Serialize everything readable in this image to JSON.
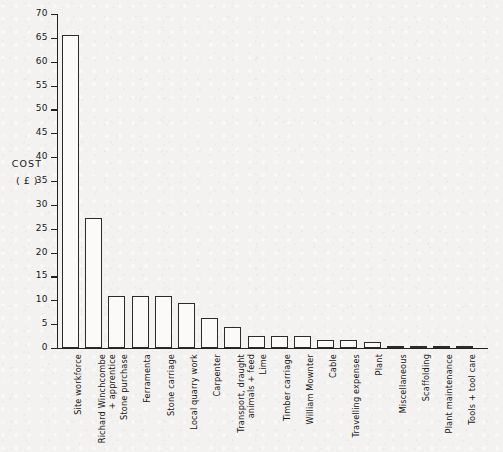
{
  "chart_data": {
    "type": "bar",
    "title": "",
    "xlabel": "",
    "ylabel": "COST",
    "ylabel_unit": "( £ )",
    "ylim": [
      0,
      70
    ],
    "ytick_step": 5,
    "yticks": [
      0,
      5,
      10,
      15,
      20,
      25,
      30,
      35,
      40,
      45,
      50,
      55,
      60,
      65,
      70
    ],
    "ytick_labels": [
      "0",
      "5",
      "10",
      "15",
      "20",
      "25",
      "30",
      "35",
      "40",
      "45",
      "50",
      "55",
      "60",
      "65",
      "70"
    ],
    "grid": false,
    "legend": "none",
    "orientation": "vertical",
    "bar_style": "outline",
    "categories": [
      "Site workforce",
      "Richard Winchcombe + apprentice",
      "Stone purchase",
      "Ferramenta",
      "Stone carriage",
      "Local quarry work",
      "Carpenter",
      "Transport, draught animals + feed",
      "Lime",
      "Timber carriage",
      "William Mownter",
      "Cable",
      "Travelling expenses",
      "Plant",
      "Miscellaneous",
      "Scaffolding",
      "Plant maintenance",
      "Tools + tool care"
    ],
    "category_lines": [
      [
        "Site workforce"
      ],
      [
        "Richard Winchcombe",
        "+ apprentice"
      ],
      [
        "Stone purchase"
      ],
      [
        "Ferramenta"
      ],
      [
        "Stone carriage"
      ],
      [
        "Local quarry work"
      ],
      [
        "Carpenter"
      ],
      [
        "Transport, draught",
        "animals + feed"
      ],
      [
        "Lime"
      ],
      [
        "Timber carriage"
      ],
      [
        "William Mownter"
      ],
      [
        "Cable"
      ],
      [
        "Travelling expenses"
      ],
      [
        "Plant"
      ],
      [
        "Miscellaneous"
      ],
      [
        "Scaffolding"
      ],
      [
        "Plant maintenance"
      ],
      [
        "Tools + tool care"
      ]
    ],
    "values": [
      65.7,
      27.3,
      11.0,
      10.9,
      10.8,
      9.5,
      6.3,
      4.4,
      2.6,
      2.6,
      2.5,
      1.6,
      1.6,
      1.2,
      0.4,
      0.4,
      0.3,
      0.3
    ]
  },
  "colors": {
    "background": "#f3f2f0",
    "axis": "#222222",
    "bar_outline": "#2b2b2b",
    "bar_fill": "#fbfaf8",
    "text": "#171717"
  }
}
